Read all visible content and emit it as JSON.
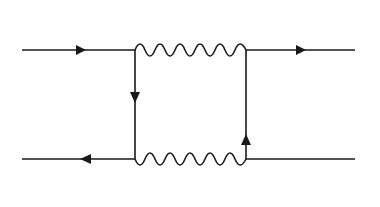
{
  "diagram": {
    "type": "feynman-box-diagram",
    "colors": {
      "line": "#1a1a1a",
      "background": "#ffffff"
    },
    "labels": {
      "d": "d",
      "top_coupling_base": "cos θ",
      "top_coupling_sub": "c",
      "mu_minus_base": "μ",
      "mu_minus_sup": "−",
      "kaon_base": "K",
      "kaon_sup": "0",
      "u": "u",
      "nu_base": "ν",
      "nu_sub": "μ",
      "s_bar": "s",
      "bottom_coupling_base": "sin θ",
      "bottom_coupling_sub": "c",
      "mu_plus_base": "μ",
      "mu_plus_sup": "+"
    },
    "propagators": [
      {
        "name": "d-quark",
        "kind": "fermion",
        "arrow": "right"
      },
      {
        "name": "W-top",
        "kind": "boson-wavy"
      },
      {
        "name": "mu-minus",
        "kind": "fermion",
        "arrow": "right"
      },
      {
        "name": "u-quark",
        "kind": "fermion",
        "arrow": "down"
      },
      {
        "name": "nu-mu",
        "kind": "fermion",
        "arrow": "up"
      },
      {
        "name": "s-antiquark",
        "kind": "fermion",
        "arrow": "left"
      },
      {
        "name": "W-bottom",
        "kind": "boson-wavy"
      },
      {
        "name": "mu-plus",
        "kind": "fermion",
        "arrow": "left"
      }
    ]
  }
}
